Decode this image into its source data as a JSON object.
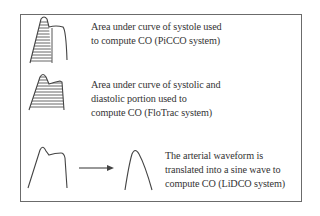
{
  "diagram": {
    "items": [
      {
        "waveform": "systolic-area-shaded",
        "lines": [
          "Area under curve of systole used",
          "to compute CO (PiCCO system)"
        ]
      },
      {
        "waveform": "systolic-diastolic-area-shaded",
        "lines": [
          "Area under curve of systolic and",
          "diastolic portion used to",
          "compute CO (FloTrac system)"
        ]
      },
      {
        "waveform": "arterial-to-sine-wave",
        "lines": [
          "The arterial waveform is",
          "translated into a sine wave to",
          "compute CO (LiDCO system)"
        ]
      }
    ],
    "colors": {
      "stroke": "#444444",
      "border": "#6b6b6b",
      "text": "#333333"
    }
  }
}
